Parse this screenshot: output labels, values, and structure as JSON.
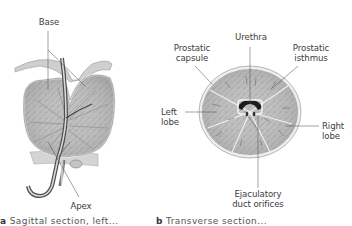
{
  "figure": {
    "panel_a": {
      "caption_letter": "a",
      "caption_text": "Sagittal section, left...",
      "labels": {
        "base": "Base",
        "apex": "Apex"
      }
    },
    "panel_b": {
      "caption_letter": "b",
      "caption_text": "Transverse section...",
      "labels": {
        "urethra": "Urethra",
        "prostatic_capsule_1": "Prostatic",
        "prostatic_capsule_2": "capsule",
        "prostatic_isthmus_1": "Prostatic",
        "prostatic_isthmus_2": "isthmus",
        "left_lobe_1": "Left",
        "left_lobe_2": "lobe",
        "right_lobe_1": "Right",
        "right_lobe_2": "lobe",
        "ejaculatory_1": "Ejaculatory",
        "ejaculatory_2": "duct orifices"
      }
    },
    "colors": {
      "tissue": "#b9b9b9",
      "tissue_dark": "#8d8d8d",
      "capsule": "#e6e6e6",
      "lumen": "#1c1c1c",
      "leader": "#555555"
    }
  }
}
